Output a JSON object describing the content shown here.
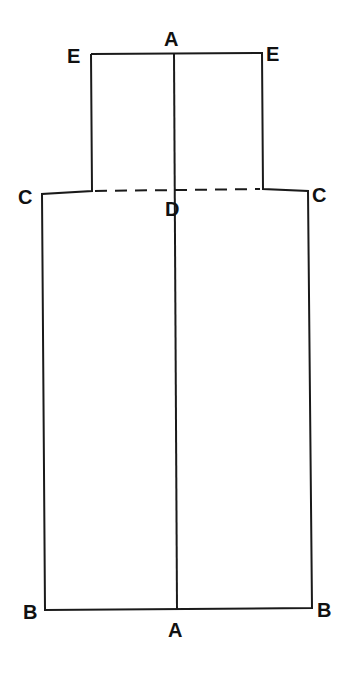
{
  "diagram": {
    "title": "",
    "line_color": "#1a1a1a",
    "background": "#ffffff",
    "points": {
      "E_left": {
        "label": "E",
        "x": 91,
        "y": 54
      },
      "E_right": {
        "label": "E",
        "x": 262,
        "y": 53
      },
      "A_top": {
        "label": "A",
        "x": 174,
        "y": 53
      },
      "C_left": {
        "label": "C",
        "x": 42,
        "y": 194
      },
      "C_right": {
        "label": "C",
        "x": 308,
        "y": 191
      },
      "D": {
        "label": "D",
        "x": 175,
        "y": 192
      },
      "B_left": {
        "label": "B",
        "x": 45,
        "y": 610
      },
      "B_right": {
        "label": "B",
        "x": 312,
        "y": 608
      },
      "A_bottom": {
        "label": "A",
        "x": 177,
        "y": 609
      }
    },
    "labels": [
      {
        "id": "label-A-top",
        "text": "A",
        "x": 164,
        "y": 46
      },
      {
        "id": "label-E-left",
        "text": "E",
        "x": 67,
        "y": 63
      },
      {
        "id": "label-E-right",
        "text": "E",
        "x": 266,
        "y": 61
      },
      {
        "id": "label-C-left",
        "text": "C",
        "x": 18,
        "y": 204
      },
      {
        "id": "label-C-right",
        "text": "C",
        "x": 312,
        "y": 202
      },
      {
        "id": "label-D",
        "text": "D",
        "x": 165,
        "y": 216
      },
      {
        "id": "label-B-left",
        "text": "B",
        "x": 23,
        "y": 619
      },
      {
        "id": "label-B-right",
        "text": "B",
        "x": 317,
        "y": 617
      },
      {
        "id": "label-A-bottom",
        "text": "A",
        "x": 168,
        "y": 637
      }
    ],
    "segments": {
      "outline": "solid",
      "center_line_A_A": "solid",
      "C_D_C_line": "dashed"
    }
  }
}
